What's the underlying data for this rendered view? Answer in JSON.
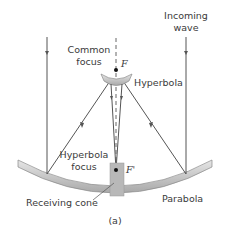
{
  "labels": {
    "incoming_wave_line1": "Incoming",
    "incoming_wave_line2": "wave",
    "common_focus_line1": "Common",
    "common_focus_line2": "focus",
    "focus_f": "F",
    "hyperbola": "Hyperbola",
    "hyperbola_focus_line1": "Hyperbola",
    "hyperbola_focus_line2": "focus",
    "focus_f_prime": "F'",
    "receiving_cone": "Receiving cone",
    "parabola": "Parabola",
    "panel": "(a)"
  },
  "colors": {
    "ray": "#555555",
    "mirror_fill": "#c9c9c9",
    "mirror_stroke": "#8a8a8a",
    "cone_fill": "#b8b8b8",
    "text": "#3a3a3a"
  }
}
